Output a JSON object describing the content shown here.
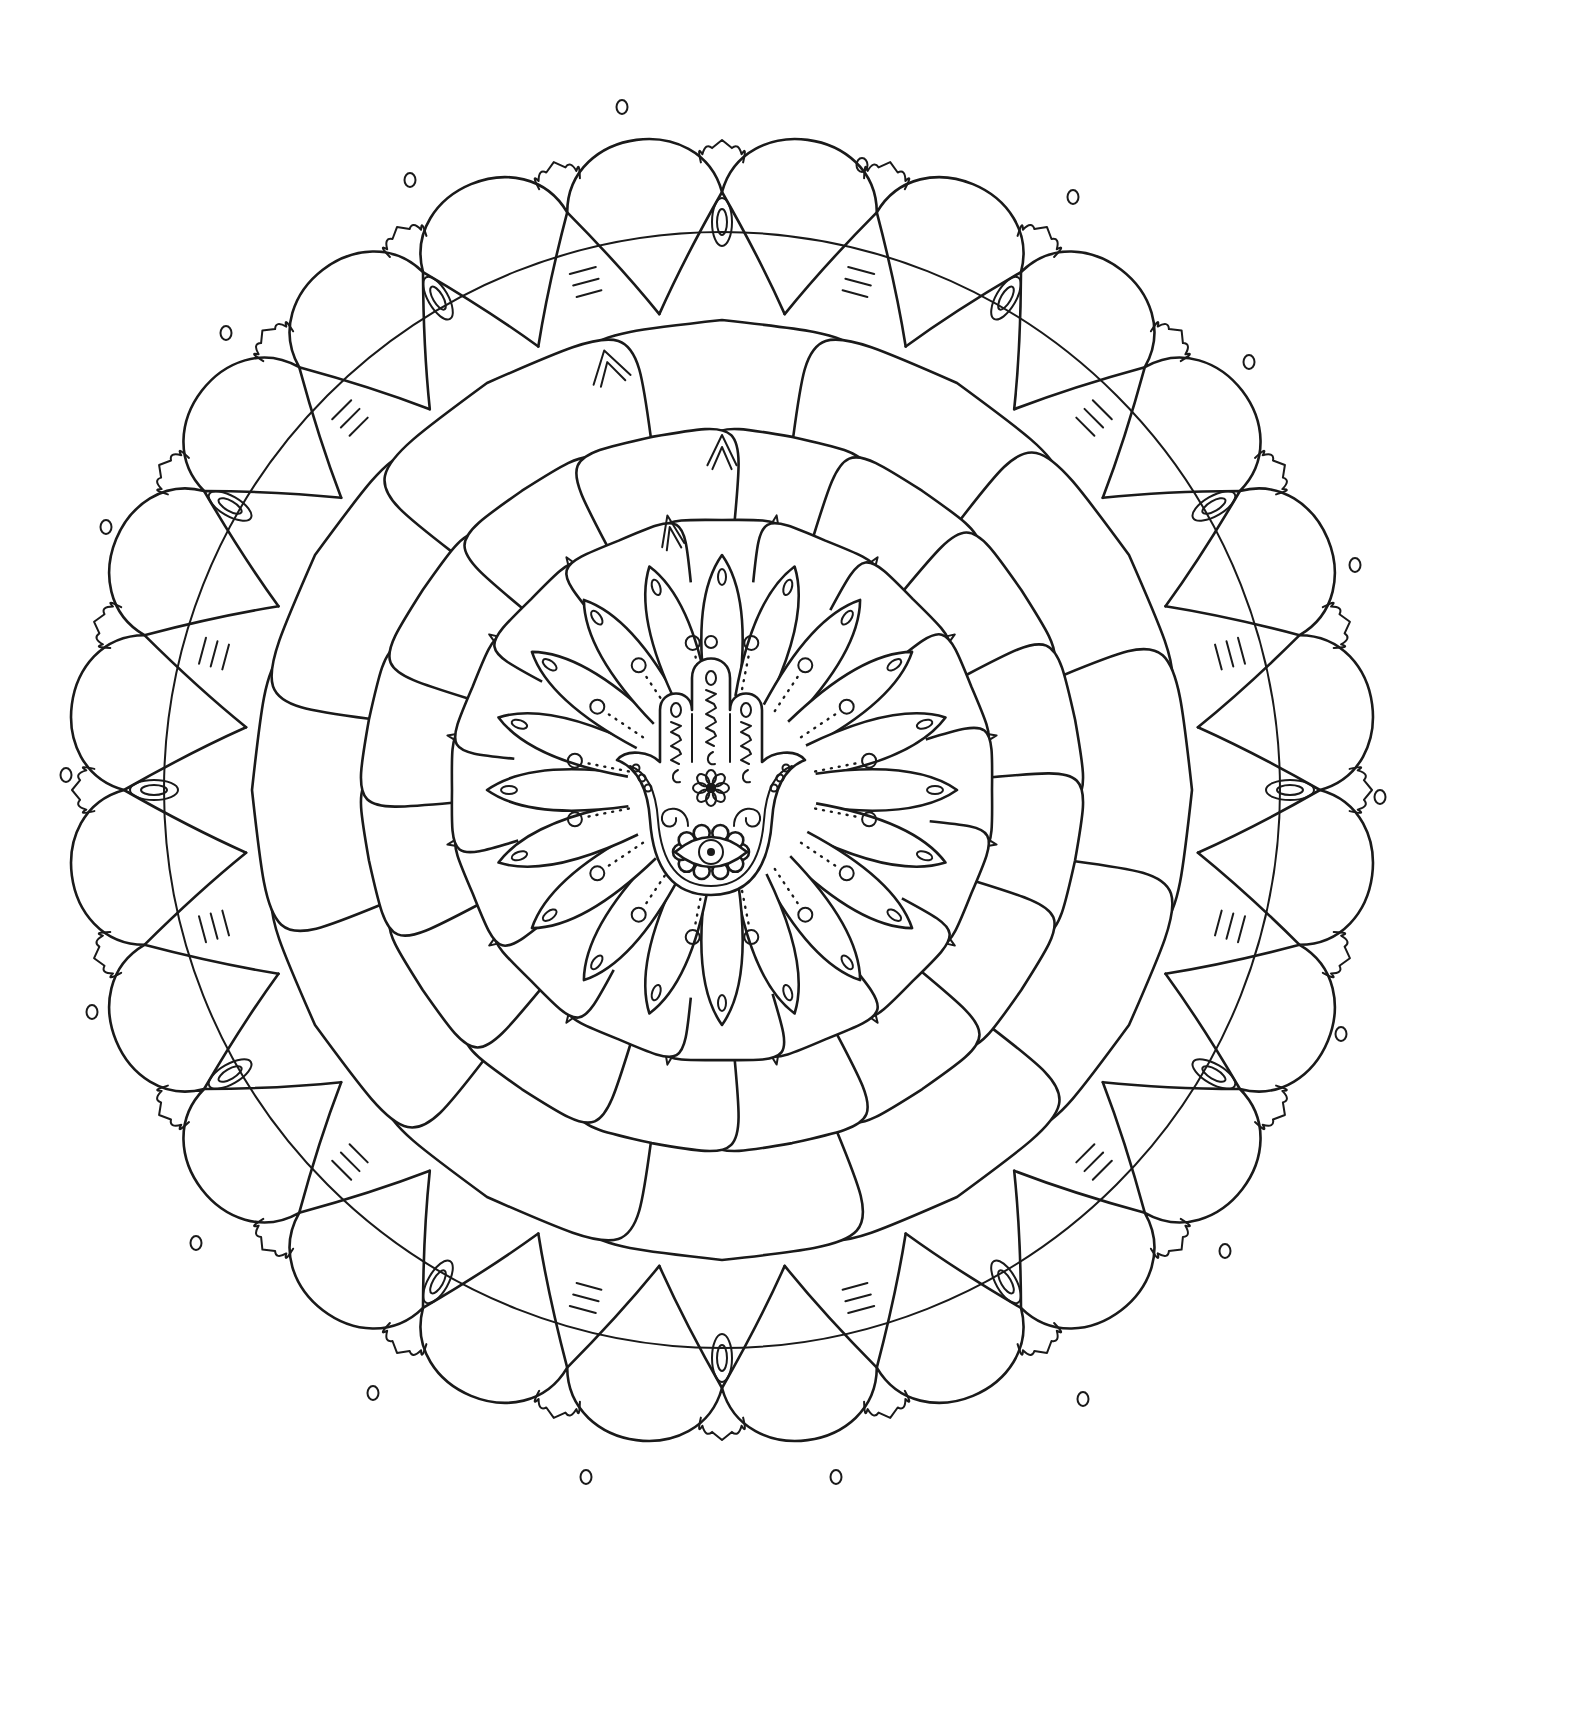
{
  "artwork": {
    "kind": "mandala-coloring-page",
    "background": "#ffffff",
    "line_color": "#1a1a1a",
    "center": [
      722,
      790
    ],
    "outer_rim": {
      "lobes": 24,
      "radius": 640,
      "crown_cusps": true
    },
    "big_circle_radius": 598,
    "spokes": {
      "count": 24,
      "alternating": [
        "striped-petal",
        "loop-knot"
      ]
    },
    "petal_rings": [
      {
        "name": "outer-large-petals",
        "count": 12,
        "radius": 470
      },
      {
        "name": "mid-petals",
        "count": 16,
        "radius": 360
      },
      {
        "name": "inner-petals",
        "count": 16,
        "radius": 270
      }
    ],
    "pointed_petal_ring": {
      "count": 20,
      "radius": 205
    },
    "dot_ring": {
      "count": 16,
      "radius": 150
    },
    "floating_dots": [
      [
        622,
        107
      ],
      [
        862,
        165
      ],
      [
        410,
        180
      ],
      [
        1073,
        197
      ],
      [
        226,
        333
      ],
      [
        1249,
        362
      ],
      [
        106,
        527
      ],
      [
        1355,
        565
      ],
      [
        66,
        775
      ],
      [
        1380,
        797
      ],
      [
        92,
        1012
      ],
      [
        1341,
        1034
      ],
      [
        196,
        1243
      ],
      [
        1225,
        1251
      ],
      [
        373,
        1393
      ],
      [
        1083,
        1399
      ],
      [
        586,
        1477
      ],
      [
        836,
        1477
      ]
    ],
    "centerpiece": {
      "type": "hamsa-hand",
      "features": [
        "evil-eye",
        "flower",
        "zigzag-fingers",
        "spirals"
      ]
    }
  }
}
